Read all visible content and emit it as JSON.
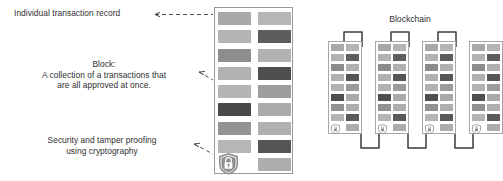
{
  "diagram": {
    "title_blockchain": "Blockchain",
    "annotations": {
      "transaction": "Individual transaction record",
      "block_line1": "Block:",
      "block_line2": "A collection of a transactions that",
      "block_line3": "are all approved at once.",
      "security_line1": "Security and tamper proofing",
      "security_line2": "using cryptography"
    },
    "colors": {
      "bar_light": "#b9b9b9",
      "bar_mid": "#9a9a9a",
      "bar_dark": "#7d7d7d",
      "bar_darkest": "#555555",
      "frame": "#9a9a9a",
      "text": "#2f2f2f",
      "leader": "#3a3a3a",
      "shield": "#8e8e8e"
    },
    "main_block": {
      "shield_icon": "shield-lock-icon",
      "rows": [
        {
          "left": "#a9a9a9",
          "right": "#b6b6b6"
        },
        {
          "left": "#b4b4b4",
          "right": "#5d5d5d"
        },
        {
          "left": "#8e8e8e",
          "right": "#b2b2b2"
        },
        {
          "left": "#b2b2b2",
          "right": "#4f4f4f"
        },
        {
          "left": "#b4b4b4",
          "right": "#9d9d9d"
        },
        {
          "left": "#4a4a4a",
          "right": "#ababab"
        },
        {
          "left": "#939393",
          "right": "#b0b0b0"
        },
        {
          "left": "#b6b6b6",
          "right": "#555555"
        },
        {
          "left": "shield",
          "right": "#aeaeae"
        }
      ]
    },
    "blockchain": {
      "shield_icon": "shield-icon",
      "blocks": [
        {
          "name": "block-1",
          "rows": [
            {
              "left": "#a8a8a8",
              "right": "#b4b4b4"
            },
            {
              "left": "#b2b2b2",
              "right": "#5e5e5e"
            },
            {
              "left": "#8c8c8c",
              "right": "#b0b0b0"
            },
            {
              "left": "#b0b0b0",
              "right": "#565656"
            },
            {
              "left": "#b2b2b2",
              "right": "#9b9b9b"
            },
            {
              "left": "#4e4e4e",
              "right": "#a9a9a9"
            },
            {
              "left": "#919191",
              "right": "#aeaeae"
            },
            {
              "left": "#b4b4b4",
              "right": "#5a5a5a"
            },
            {
              "left": "shield",
              "right": "#acacac"
            }
          ]
        },
        {
          "name": "block-2",
          "rows": [
            {
              "left": "#a8a8a8",
              "right": "#b4b4b4"
            },
            {
              "left": "#b2b2b2",
              "right": "#5e5e5e"
            },
            {
              "left": "#8c8c8c",
              "right": "#b0b0b0"
            },
            {
              "left": "#b0b0b0",
              "right": "#565656"
            },
            {
              "left": "#b2b2b2",
              "right": "#9b9b9b"
            },
            {
              "left": "#4e4e4e",
              "right": "#a9a9a9"
            },
            {
              "left": "#919191",
              "right": "#aeaeae"
            },
            {
              "left": "#b4b4b4",
              "right": "#5a5a5a"
            },
            {
              "left": "shield",
              "right": "#acacac"
            }
          ]
        },
        {
          "name": "block-3",
          "rows": [
            {
              "left": "#a8a8a8",
              "right": "#b4b4b4"
            },
            {
              "left": "#b2b2b2",
              "right": "#5e5e5e"
            },
            {
              "left": "#8c8c8c",
              "right": "#b0b0b0"
            },
            {
              "left": "#b0b0b0",
              "right": "#565656"
            },
            {
              "left": "#b2b2b2",
              "right": "#9b9b9b"
            },
            {
              "left": "#4e4e4e",
              "right": "#a9a9a9"
            },
            {
              "left": "#919191",
              "right": "#aeaeae"
            },
            {
              "left": "#b4b4b4",
              "right": "#5a5a5a"
            },
            {
              "left": "shield",
              "right": "#acacac"
            }
          ]
        },
        {
          "name": "block-4",
          "rows": [
            {
              "left": "#a8a8a8",
              "right": "#b4b4b4"
            },
            {
              "left": "#b2b2b2",
              "right": "#5e5e5e"
            },
            {
              "left": "#8c8c8c",
              "right": "#b0b0b0"
            },
            {
              "left": "#b0b0b0",
              "right": "#565656"
            },
            {
              "left": "#b2b2b2",
              "right": "#9b9b9b"
            },
            {
              "left": "#4e4e4e",
              "right": "#a9a9a9"
            },
            {
              "left": "#919191",
              "right": "#aeaeae"
            },
            {
              "left": "#b4b4b4",
              "right": "#5a5a5a"
            },
            {
              "left": "shield",
              "right": "#acacac"
            }
          ]
        }
      ]
    }
  }
}
